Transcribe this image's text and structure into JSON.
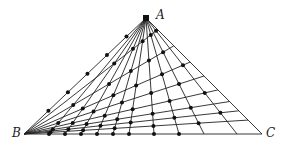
{
  "labels": {
    "A": "A",
    "B": "B",
    "C": "C"
  },
  "points": {
    "A": [
      146,
      18
    ],
    "B": [
      24,
      134
    ],
    "C": [
      262,
      134
    ]
  },
  "colors": {
    "line": "#222222",
    "dot": "#111111",
    "background": "#ffffff"
  },
  "fan_from_A_to_BC_x": [
    49,
    65,
    81,
    97,
    113,
    129,
    154,
    179,
    204,
    237
  ],
  "fan_from_B_to_AC_t": [
    0.12,
    0.2,
    0.28,
    0.38,
    0.5,
    0.62,
    0.76,
    0.9
  ],
  "dots_on_AB_t": [
    0.2,
    0.36,
    0.52,
    0.68,
    0.84
  ]
}
